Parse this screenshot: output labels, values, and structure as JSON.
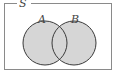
{
  "diagram": {
    "type": "venn",
    "universe_label": "S",
    "sets": [
      {
        "label": "A",
        "cx": 45,
        "cy": 43,
        "r": 22
      },
      {
        "label": "B",
        "cx": 74,
        "cy": 43,
        "r": 22
      }
    ],
    "shaded_region": "A ∪ B",
    "colors": {
      "fill": "#d6d6d6",
      "stroke": "#3a3a3a",
      "border": "#8a8a8a"
    }
  }
}
